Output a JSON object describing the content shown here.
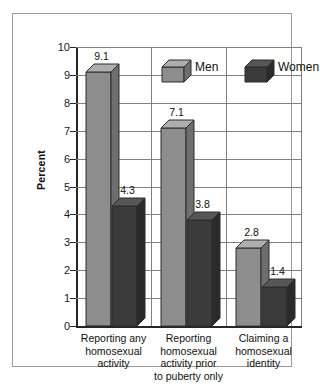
{
  "chart_data": {
    "type": "bar",
    "title": "",
    "subtitle": "",
    "xlabel": "",
    "ylabel": "Percent",
    "ylim": [
      0,
      10
    ],
    "ytick_labels": [
      "10",
      "9",
      "8",
      "7",
      "6",
      "5",
      "4",
      "3",
      "2",
      "1",
      "0"
    ],
    "ytick_values": [
      10,
      9,
      8,
      7,
      6,
      5,
      4,
      3,
      2,
      1,
      0
    ],
    "grid": "horizontal-and-vertical",
    "legend_position": "top-center",
    "categories": [
      "Reporting any homosexual activity",
      "Reporting homosexual activity prior to puberty only",
      "Claiming a homosexual identity"
    ],
    "category_lines": [
      [
        "Reporting any",
        "homosexual",
        "activity"
      ],
      [
        "Reporting",
        "homosexual",
        "activity prior",
        "to puberty only"
      ],
      [
        "Claiming a",
        "homosexual",
        "identity"
      ]
    ],
    "series": [
      {
        "name": "Men",
        "color": "#8d8d8d",
        "values": [
          9.1,
          7.1,
          2.8
        ],
        "value_labels": [
          "9.1",
          "7.1",
          "2.8"
        ]
      },
      {
        "name": "Women",
        "color": "#3b3b3b",
        "values": [
          4.3,
          3.8,
          1.4
        ],
        "value_labels": [
          "4.3",
          "3.8",
          "1.4"
        ]
      }
    ],
    "style": "3d-column",
    "axis_color": "#262626",
    "grid_color": "#808080",
    "background": "#ffffff"
  }
}
